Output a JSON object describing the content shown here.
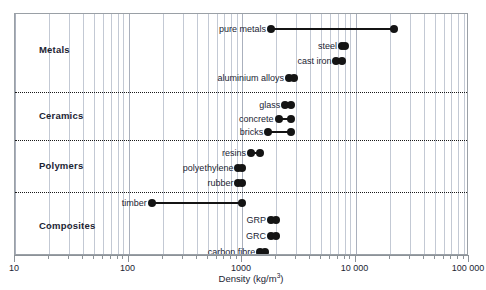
{
  "chart_data": {
    "type": "bar",
    "title": "",
    "xlabel": "Density (kg/m³)",
    "ylabel": "",
    "scale": "log",
    "xlim": [
      10,
      100000
    ],
    "grid": true,
    "legend_position": "none",
    "tick_labels": [
      "10",
      "100",
      "1000",
      "10 000",
      "100 000"
    ],
    "tick_values": [
      10,
      100,
      1000,
      10000,
      100000
    ],
    "groups": [
      {
        "name": "Metals",
        "items": [
          {
            "label": "pure metals",
            "min": 1800,
            "max": 22000
          },
          {
            "label": "steel",
            "min": 7600,
            "max": 8100
          },
          {
            "label": "cast iron",
            "min": 6800,
            "max": 7600
          },
          {
            "label": "aluminium alloys",
            "min": 2600,
            "max": 2900
          }
        ]
      },
      {
        "name": "Ceramics",
        "items": [
          {
            "label": "glass",
            "min": 2400,
            "max": 2700
          },
          {
            "label": "concrete",
            "min": 2100,
            "max": 2700
          },
          {
            "label": "bricks",
            "min": 1700,
            "max": 2700
          }
        ]
      },
      {
        "name": "Polymers",
        "items": [
          {
            "label": "resins",
            "min": 1200,
            "max": 1450
          },
          {
            "label": "polyethylene",
            "min": 930,
            "max": 1000
          },
          {
            "label": "rubber",
            "min": 930,
            "max": 1000
          }
        ]
      },
      {
        "name": "Composites",
        "items": [
          {
            "label": "timber",
            "min": 160,
            "max": 1000
          },
          {
            "label": "GRP",
            "min": 1800,
            "max": 2000
          },
          {
            "label": "GRC",
            "min": 1800,
            "max": 2000
          },
          {
            "label": "carbon fibre",
            "min": 1450,
            "max": 1600
          }
        ]
      }
    ]
  },
  "axis": {
    "title": "Density (kg/m",
    "title_sup": "3",
    "title_tail": ")"
  }
}
